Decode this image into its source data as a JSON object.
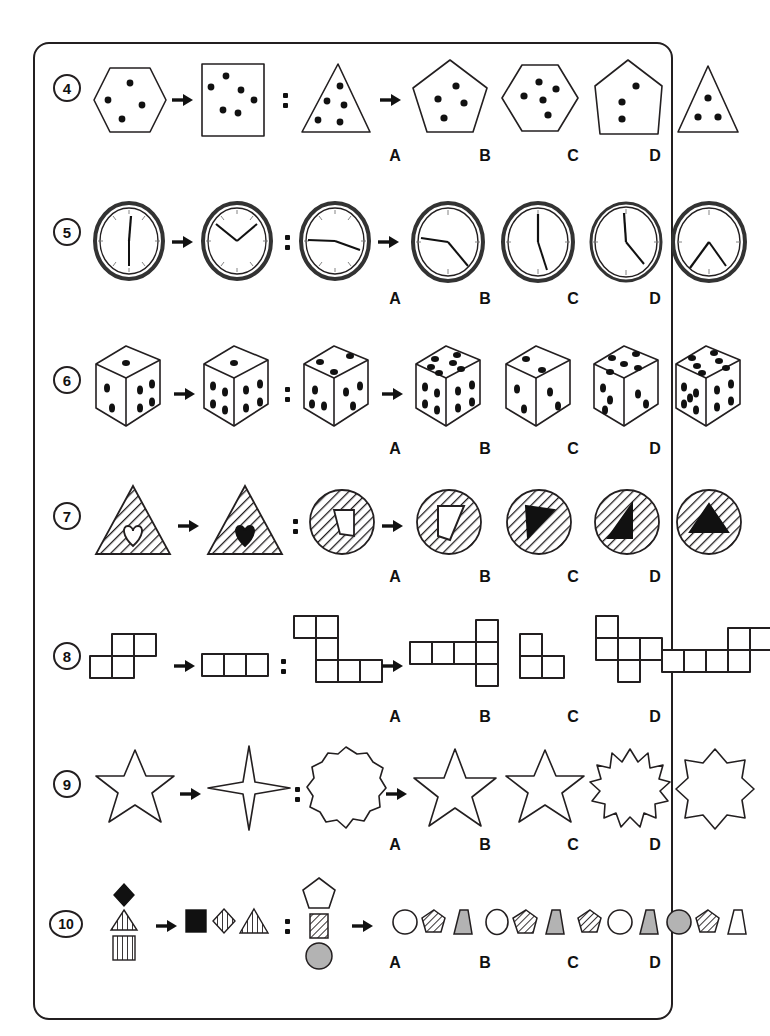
{
  "page": {
    "background": "#ffffff",
    "ink_color": "#231f20",
    "accent_gray": "#b3b3b3"
  },
  "option_labels": [
    "A",
    "B",
    "C",
    "D"
  ],
  "questions": [
    {
      "number": "4",
      "theme": "dotted-polygons",
      "prompt": {
        "term1": "hexagon with 4 dots",
        "term2": "square with 6 dots",
        "term3": "triangle with 5 dots"
      },
      "options": [
        {
          "label": "A",
          "desc": "pentagon with 4 dots"
        },
        {
          "label": "B",
          "desc": "hexagon with 5 dots"
        },
        {
          "label": "C",
          "desc": "pentagon with 3 dots"
        },
        {
          "label": "D",
          "desc": "triangle with 3 dots"
        }
      ]
    },
    {
      "number": "5",
      "theme": "clock-faces",
      "prompt": {
        "term1": "clock showing 12:30",
        "term2": "clock showing 10:10",
        "term3": "clock showing 9:20"
      },
      "options": [
        {
          "label": "A",
          "desc": "clock showing 9:25"
        },
        {
          "label": "B",
          "desc": "clock showing 12:25"
        },
        {
          "label": "C",
          "desc": "clock showing 12:20"
        },
        {
          "label": "D",
          "desc": "clock showing 7:25"
        }
      ]
    },
    {
      "number": "6",
      "theme": "dice-cubes",
      "prompt": {
        "term1": "die showing 1, 3, 4",
        "term2": "die showing 1, 4, 4",
        "term3": "die showing 4, 3, 3"
      },
      "options": [
        {
          "label": "A",
          "desc": "die showing 6, 4, 4"
        },
        {
          "label": "B",
          "desc": "die showing 2, 2, 2"
        },
        {
          "label": "C",
          "desc": "die showing 5, 3, 2"
        },
        {
          "label": "D",
          "desc": "die showing 6, 5, 4"
        }
      ]
    },
    {
      "number": "7",
      "theme": "hatched-figures",
      "prompt": {
        "term1": "hatched triangle with white heart",
        "term2": "hatched triangle with black heart",
        "term3": "hatched circle with white quadrilateral"
      },
      "options": [
        {
          "label": "A",
          "desc": "hatched circle with white quadrilateral outline"
        },
        {
          "label": "B",
          "desc": "hatched circle with black right triangle"
        },
        {
          "label": "C",
          "desc": "hatched circle with black triangle pointing left"
        },
        {
          "label": "D",
          "desc": "hatched circle with black triangle pointing up"
        }
      ]
    },
    {
      "number": "8",
      "theme": "grid-polyominoes",
      "prompt": {
        "term1": "P-shaped tetromino arrangement",
        "term2": "horizontal row of three squares",
        "term3": "Z-shaped polyomino of six squares"
      },
      "options": [
        {
          "label": "A",
          "desc": "row of four squares with vertical pair at right"
        },
        {
          "label": "B",
          "desc": "L-shaped tromino"
        },
        {
          "label": "C",
          "desc": "plus-like polyomino of five squares"
        },
        {
          "label": "D",
          "desc": "row of four squares with two raised squares at right"
        }
      ]
    },
    {
      "number": "9",
      "theme": "stars",
      "prompt": {
        "term1": "six-pointed star",
        "term2": "four-pointed star",
        "term3": "twelve-lobed scalloped circle"
      },
      "options": [
        {
          "label": "A",
          "desc": "five-pointed star"
        },
        {
          "label": "B",
          "desc": "six-pointed star"
        },
        {
          "label": "C",
          "desc": "twelve-pointed spiky star"
        },
        {
          "label": "D",
          "desc": "eight-pointed star"
        }
      ]
    },
    {
      "number": "10",
      "theme": "shape-groups",
      "prompt": {
        "term1": "vertical group: black diamond, striped triangle, striped square",
        "term2": "horizontal group: black square, striped diamond, striped triangle",
        "term3": "vertical group: white pentagon, striped square, gray circle"
      },
      "options": [
        {
          "label": "A",
          "desc": "white circle, striped pentagon, gray trapezoid"
        },
        {
          "label": "B",
          "desc": "white circle, striped pentagon, gray trapezoid"
        },
        {
          "label": "C",
          "desc": "striped pentagon, white circle, gray trapezoid"
        },
        {
          "label": "D",
          "desc": "gray circle, striped pentagon, white trapezoid"
        }
      ]
    }
  ]
}
